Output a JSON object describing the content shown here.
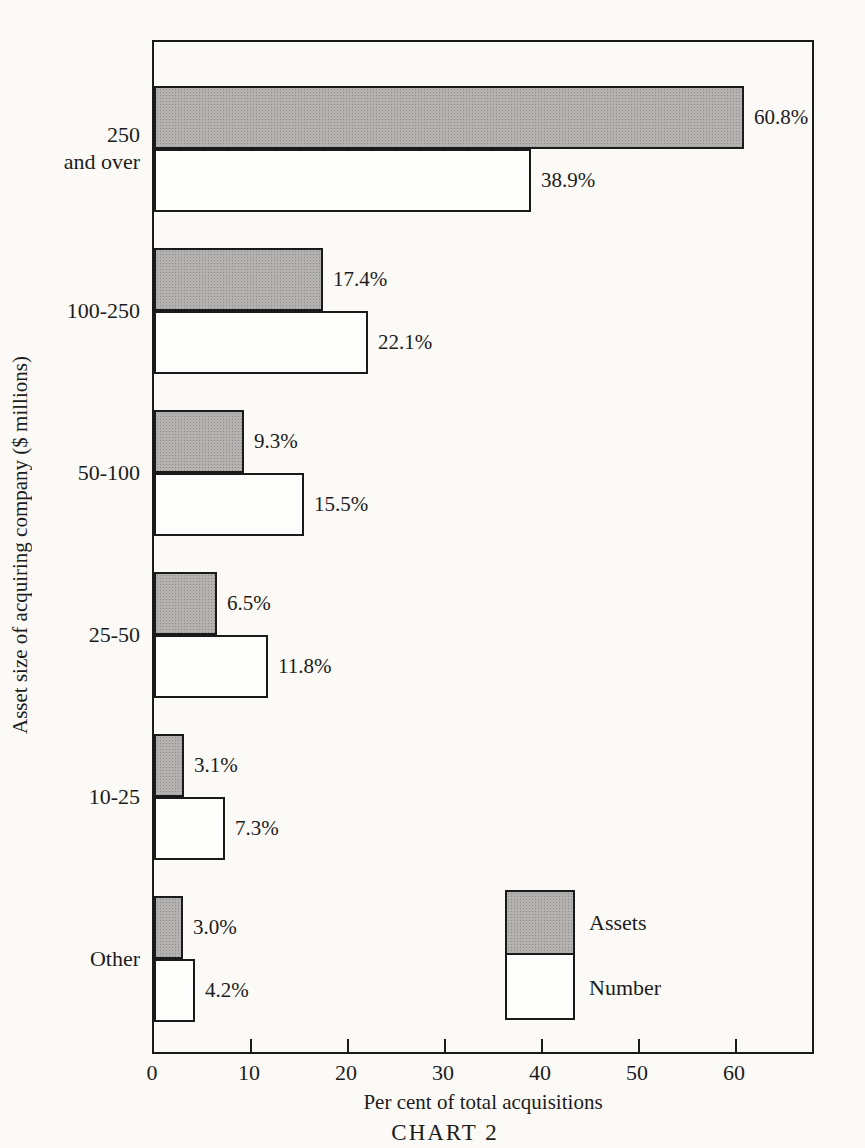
{
  "page": {
    "caption": "CHART 2",
    "background": "#fbfaf7"
  },
  "axes": {
    "xlabel": "Per cent of total acquisitions",
    "ylabel": "Asset size of acquiring company ($ millions)"
  },
  "legend": {
    "items": [
      {
        "label": "Assets",
        "swatch": "gray-halftone"
      },
      {
        "label": "Number",
        "swatch": "white"
      }
    ]
  },
  "chart_data": {
    "type": "bar",
    "orientation": "horizontal",
    "title": "CHART 2",
    "xlabel": "Per cent of total acquisitions",
    "ylabel": "Asset size of acquiring company ($ millions)",
    "xlim": [
      0,
      68
    ],
    "xticks": [
      0,
      10,
      20,
      30,
      40,
      50,
      60
    ],
    "grid": false,
    "legend_position": "inside lower right",
    "categories": [
      "250 and over",
      "100-250",
      "50-100",
      "25-50",
      "10-25",
      "Other"
    ],
    "category_label_lines": [
      [
        "250",
        "and over"
      ],
      [
        "100-250"
      ],
      [
        "50-100"
      ],
      [
        "25-50"
      ],
      [
        "10-25"
      ],
      [
        "Other"
      ]
    ],
    "series": [
      {
        "name": "Assets",
        "color": "#b4b2b0",
        "values": [
          60.8,
          17.4,
          9.3,
          6.5,
          3.1,
          3.0
        ],
        "labels": [
          "60.8%",
          "17.4%",
          "9.3%",
          "6.5%",
          "3.1%",
          "3.0%"
        ]
      },
      {
        "name": "Number",
        "color": "#fdfdfc",
        "values": [
          38.9,
          22.1,
          15.5,
          11.8,
          7.3,
          4.2
        ],
        "labels": [
          "38.9%",
          "22.1%",
          "15.5%",
          "11.8%",
          "7.3%",
          "4.2%"
        ]
      }
    ]
  }
}
